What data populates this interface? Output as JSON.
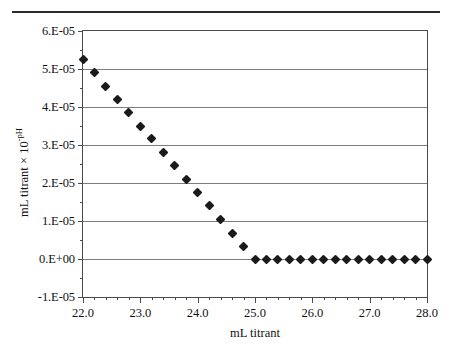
{
  "figure": {
    "has_top_rule": true,
    "background_color": "#ffffff",
    "marker_color": "#1a1a1a",
    "gridline_color": "#7d7d7d",
    "axis_color": "#4a4a4a"
  },
  "axis_titles": {
    "x": "mL titrant",
    "y_prefix": "mL titrant × 10",
    "y_exponent": "-pH"
  },
  "chart_data": {
    "type": "scatter",
    "title": "",
    "xlabel": "mL titrant",
    "ylabel": "mL titrant × 10^-pH",
    "xlim": [
      22.0,
      28.0
    ],
    "ylim": [
      -1e-05,
      6e-05
    ],
    "grid": true,
    "legend": null,
    "xticks": [
      22.0,
      23.0,
      24.0,
      25.0,
      26.0,
      27.0,
      28.0
    ],
    "xtick_labels": [
      "22.0",
      "23.0",
      "24.0",
      "25.0",
      "26.0",
      "27.0",
      "28.0"
    ],
    "xtick_minor_step": 0.2,
    "yticks": [
      -1e-05,
      0.0,
      1e-05,
      2e-05,
      3e-05,
      4e-05,
      5e-05,
      6e-05
    ],
    "ytick_labels": [
      "-1.E-05",
      "0.E+00",
      "1.E-05",
      "2.E-05",
      "3.E-05",
      "4.E-05",
      "5.E-05",
      "6.E-05"
    ],
    "marker": "diamond",
    "x": [
      22.0,
      22.2,
      22.4,
      22.6,
      22.8,
      23.0,
      23.2,
      23.4,
      23.6,
      23.8,
      24.0,
      24.2,
      24.4,
      24.6,
      24.8,
      25.0,
      25.2,
      25.4,
      25.6,
      25.8,
      26.0,
      26.2,
      26.4,
      26.6,
      26.8,
      27.0,
      27.2,
      27.4,
      27.6,
      27.8,
      28.0
    ],
    "values": [
      5.24e-05,
      4.9e-05,
      4.55e-05,
      4.2e-05,
      3.86e-05,
      3.5e-05,
      3.16e-05,
      2.81e-05,
      2.45e-05,
      2.09e-05,
      1.74e-05,
      1.4e-05,
      1.03e-05,
      6.8e-06,
      3.3e-06,
      0.0,
      0.0,
      0.0,
      0.0,
      0.0,
      0.0,
      0.0,
      0.0,
      0.0,
      0.0,
      0.0,
      0.0,
      0.0,
      0.0,
      0.0,
      0.0
    ]
  }
}
